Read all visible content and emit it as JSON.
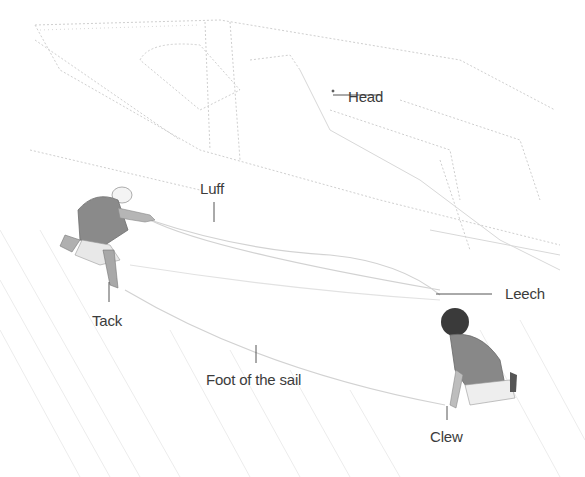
{
  "diagram": {
    "colors": {
      "label_text": "#3c3c3c",
      "leader_line": "#555555",
      "sketch_line": "#c8c8c8",
      "shirt": "#8a8a8a",
      "hair_dark": "#3a3a3a"
    },
    "labels": {
      "head": "Head",
      "luff": "Luff",
      "leech": "Leech",
      "tack": "Tack",
      "foot": "Foot of the sail",
      "clew": "Clew"
    }
  }
}
